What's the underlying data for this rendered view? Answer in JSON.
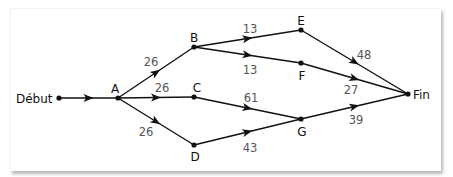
{
  "diagram": {
    "type": "directed-network",
    "nodes": [
      {
        "id": "debut",
        "label": "Début",
        "x": 59,
        "y": 98,
        "lx": 16,
        "ly": 103,
        "anchor": "start"
      },
      {
        "id": "A",
        "label": "A",
        "x": 118,
        "y": 98,
        "lx": 115,
        "ly": 93,
        "anchor": "middle"
      },
      {
        "id": "B",
        "label": "B",
        "x": 194,
        "y": 47,
        "lx": 194,
        "ly": 42,
        "anchor": "middle"
      },
      {
        "id": "C",
        "label": "C",
        "x": 194,
        "y": 97,
        "lx": 197,
        "ly": 92,
        "anchor": "middle"
      },
      {
        "id": "D",
        "label": "D",
        "x": 194,
        "y": 145,
        "lx": 195,
        "ly": 161,
        "anchor": "middle"
      },
      {
        "id": "E",
        "label": "E",
        "x": 301,
        "y": 30,
        "lx": 301,
        "ly": 25,
        "anchor": "middle"
      },
      {
        "id": "F",
        "label": "F",
        "x": 301,
        "y": 63,
        "lx": 302,
        "ly": 80,
        "anchor": "middle"
      },
      {
        "id": "G",
        "label": "G",
        "x": 301,
        "y": 119,
        "lx": 302,
        "ly": 136,
        "anchor": "middle"
      },
      {
        "id": "fin",
        "label": "Fin",
        "x": 408,
        "y": 94,
        "lx": 413,
        "ly": 99,
        "anchor": "start"
      }
    ],
    "edges": [
      {
        "from": "debut",
        "to": "A",
        "weight": "",
        "lx": 0,
        "ly": 0
      },
      {
        "from": "A",
        "to": "B",
        "weight": "26",
        "lx": 151,
        "ly": 66
      },
      {
        "from": "A",
        "to": "C",
        "weight": "26",
        "lx": 162,
        "ly": 92
      },
      {
        "from": "A",
        "to": "D",
        "weight": "26",
        "lx": 146,
        "ly": 136
      },
      {
        "from": "B",
        "to": "E",
        "weight": "13",
        "lx": 250,
        "ly": 33
      },
      {
        "from": "B",
        "to": "F",
        "weight": "13",
        "lx": 250,
        "ly": 74
      },
      {
        "from": "C",
        "to": "G",
        "weight": "61",
        "lx": 251,
        "ly": 102
      },
      {
        "from": "D",
        "to": "G",
        "weight": "43",
        "lx": 250,
        "ly": 152
      },
      {
        "from": "E",
        "to": "fin",
        "weight": "48",
        "lx": 364,
        "ly": 59
      },
      {
        "from": "F",
        "to": "fin",
        "weight": "27",
        "lx": 351,
        "ly": 94
      },
      {
        "from": "G",
        "to": "fin",
        "weight": "39",
        "lx": 356,
        "ly": 124
      }
    ]
  }
}
